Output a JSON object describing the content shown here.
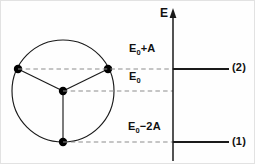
{
  "figure": {
    "axis": {
      "label": "E",
      "name": "energy-axis",
      "x": 172,
      "top": 10,
      "bottom": 160,
      "arrow": "up-arrow"
    },
    "colors": {
      "stroke": "#1a1a1a",
      "dashed": "#8c8c8c",
      "node": "#000000",
      "background": "#ffffff"
    },
    "molecule": {
      "name": "three-site-ring",
      "circle": {
        "cx": 62,
        "cy": 90,
        "r": 51
      },
      "center_node": {
        "x": 62,
        "y": 90
      },
      "vertices": [
        {
          "name": "site-left",
          "x": 17,
          "y": 68
        },
        {
          "name": "site-right",
          "x": 107,
          "y": 68
        },
        {
          "name": "site-bottom",
          "x": 62,
          "y": 141
        }
      ],
      "node_radius": 4.2
    },
    "levels": [
      {
        "id": "level-upper",
        "energy_label": "E",
        "energy_sub": "0",
        "energy_rest": "+A",
        "state_label": "(2)",
        "y": 68,
        "dash_from": 17,
        "dash_to": 172,
        "solid_from": 172,
        "solid_to": 228,
        "has_solid_line": true
      },
      {
        "id": "level-reference",
        "energy_label": "E",
        "energy_sub": "0",
        "energy_rest": "",
        "state_label": "",
        "y": 90,
        "dash_from": 62,
        "dash_to": 172,
        "solid_from": 0,
        "solid_to": 0,
        "has_solid_line": false
      },
      {
        "id": "level-lower",
        "energy_label": "E",
        "energy_sub": "0",
        "energy_rest": "−2A",
        "state_label": "(1)",
        "y": 141,
        "dash_from": 62,
        "dash_to": 172,
        "solid_from": 172,
        "solid_to": 228,
        "has_solid_line": true
      }
    ],
    "text": {
      "energy_upper_main": "E",
      "energy_upper_sub": "0",
      "energy_upper_tail": "+A",
      "energy_middle_main": "E",
      "energy_middle_sub": "0",
      "energy_middle_tail": "",
      "energy_lower_main": "E",
      "energy_lower_sub": "0",
      "energy_lower_tail": "−2A",
      "state_upper": "(2)",
      "state_lower": "(1)",
      "axis_label": "E"
    }
  }
}
